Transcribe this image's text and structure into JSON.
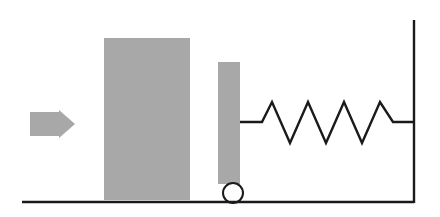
{
  "canvas": {
    "width": 440,
    "height": 217,
    "background": "#ffffff"
  },
  "palette": {
    "fill_gray": "#a8a8a8",
    "stroke_black": "#1a1a1a",
    "background": "#ffffff"
  },
  "diagram": {
    "type": "mechanics-schematic",
    "elements": [
      {
        "id": "force-arrow",
        "name": "force-arrow",
        "shape": "arrow-right",
        "fill": "#a8a8a8",
        "x": 30,
        "y": 110,
        "width": 45,
        "height": 28,
        "points": "30,112 59,112 59,110 75,124 59,138 59,136 30,136"
      },
      {
        "id": "large-block",
        "name": "large-block",
        "shape": "rectangle",
        "fill": "#a8a8a8",
        "x": 104,
        "y": 38,
        "width": 86,
        "height": 162
      },
      {
        "id": "narrow-plate",
        "name": "narrow-plate",
        "shape": "rectangle",
        "fill": "#a8a8a8",
        "x": 218,
        "y": 62,
        "width": 22,
        "height": 122
      },
      {
        "id": "wheel",
        "name": "wheel-circle",
        "shape": "circle",
        "fill": "none",
        "stroke": "#1a1a1a",
        "stroke_width": 2,
        "cx": 233,
        "cy": 193,
        "r": 10
      },
      {
        "id": "spring",
        "name": "spring-coil",
        "shape": "polyline",
        "stroke": "#1a1a1a",
        "stroke_width": 2.4,
        "fill": "none",
        "centerline_y": 122,
        "peak_y": 102,
        "valley_y": 143,
        "start_x": 240,
        "end_x": 414,
        "coil_count": 4,
        "points": "240,122 262,122 272,102 290,143 308,102 326,143 344,102 362,143 380,102 393,122 414,122"
      },
      {
        "id": "wall",
        "name": "wall-line",
        "shape": "line",
        "stroke": "#1a1a1a",
        "stroke_width": 2.4,
        "x1": 414,
        "y1": 20,
        "x2": 414,
        "y2": 203
      },
      {
        "id": "ground",
        "name": "ground-line",
        "shape": "line",
        "stroke": "#1a1a1a",
        "stroke_width": 2.4,
        "x1": 22,
        "y1": 202,
        "x2": 414,
        "y2": 202
      }
    ]
  }
}
